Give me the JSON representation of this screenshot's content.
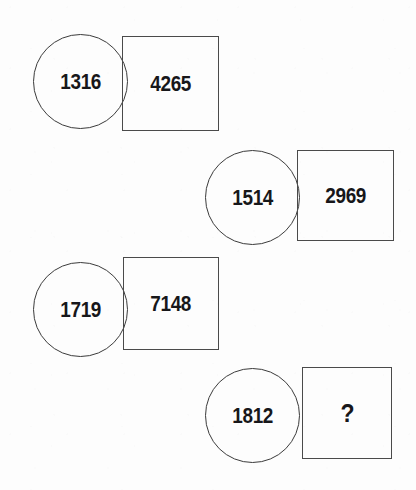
{
  "puzzle": {
    "type": "number-sequence-visual-puzzle",
    "background_color": "#fdfdfd",
    "stroke_color": "#3b3b3b",
    "text_color": "#17171a",
    "unknown_marker": "?",
    "pairs": [
      {
        "id": "pair-1",
        "circle_value": "1316",
        "square_value": "4265",
        "circle": {
          "x": 33,
          "y": 34,
          "size": 95
        },
        "square": {
          "x": 122,
          "y": 36,
          "width": 97,
          "height": 95
        }
      },
      {
        "id": "pair-2",
        "circle_value": "1514",
        "square_value": "2969",
        "circle": {
          "x": 205,
          "y": 150,
          "size": 95
        },
        "square": {
          "x": 297,
          "y": 150,
          "width": 97,
          "height": 91
        }
      },
      {
        "id": "pair-3",
        "circle_value": "1719",
        "square_value": "7148",
        "circle": {
          "x": 33,
          "y": 262,
          "size": 95
        },
        "square": {
          "x": 123,
          "y": 257,
          "width": 96,
          "height": 93
        }
      },
      {
        "id": "pair-4",
        "circle_value": "1812",
        "square_value": "?",
        "circle": {
          "x": 205,
          "y": 368,
          "size": 95
        },
        "square": {
          "x": 302,
          "y": 367,
          "width": 90,
          "height": 92
        }
      }
    ]
  }
}
